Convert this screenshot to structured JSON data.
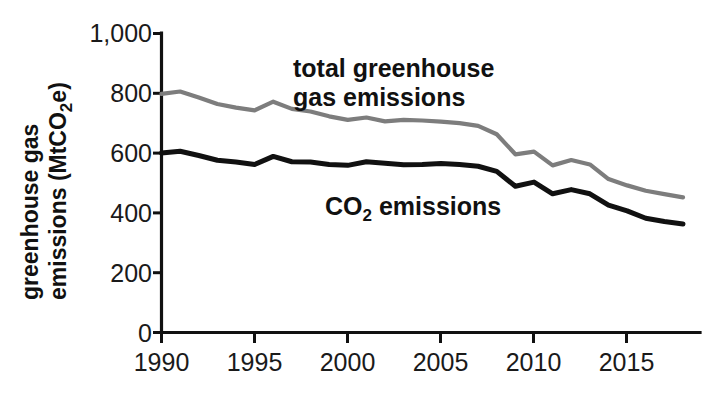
{
  "chart_data": {
    "type": "line",
    "title": "",
    "xlabel": "",
    "ylabel": "greenhouse gas emissions (MtCO2e)",
    "ylabel_parts": {
      "pre": "greenhouse gas emissions (MtCO",
      "sub": "2",
      "post": "e)"
    },
    "xlim": [
      1990,
      2018
    ],
    "ylim": [
      0,
      1000
    ],
    "grid": false,
    "legend_position": "inline-annotation",
    "y_ticks": [
      0,
      200,
      400,
      600,
      800,
      1000
    ],
    "y_tick_labels": [
      "0",
      "200",
      "400",
      "600",
      "800",
      "1,000"
    ],
    "x_ticks": [
      1990,
      1995,
      2000,
      2005,
      2010,
      2015
    ],
    "x_tick_labels": [
      "1990",
      "1995",
      "2000",
      "2005",
      "2010",
      "2015"
    ],
    "x": [
      1990,
      1991,
      1992,
      1993,
      1994,
      1995,
      1996,
      1997,
      1998,
      1999,
      2000,
      2001,
      2002,
      2003,
      2004,
      2005,
      2006,
      2007,
      2008,
      2009,
      2010,
      2011,
      2012,
      2013,
      2014,
      2015,
      2016,
      2017,
      2018
    ],
    "series": [
      {
        "name": "total greenhouse gas emissions",
        "color": "#7d7d7d",
        "label_lines": [
          "total greenhouse",
          "gas emissions"
        ],
        "values": [
          798,
          806,
          786,
          764,
          752,
          743,
          772,
          748,
          739,
          723,
          711,
          719,
          706,
          711,
          709,
          705,
          700,
          691,
          663,
          596,
          605,
          559,
          577,
          562,
          513,
          492,
          474,
          463,
          452
        ]
      },
      {
        "name": "CO2 emissions",
        "color": "#111111",
        "label_parts": {
          "pre": "CO",
          "sub": "2",
          "post": " emissions"
        },
        "values": [
          600,
          606,
          592,
          576,
          570,
          562,
          589,
          571,
          570,
          562,
          559,
          571,
          566,
          561,
          562,
          565,
          562,
          556,
          539,
          489,
          503,
          464,
          478,
          464,
          426,
          407,
          382,
          371,
          363
        ]
      }
    ],
    "annotations": [
      {
        "id": "total-ghg-label",
        "text": "total greenhouse gas emissions",
        "at_x": 2001,
        "at_y": 880
      },
      {
        "id": "co2-label",
        "text": "CO2 emissions",
        "at_x": 2002,
        "at_y": 430
      }
    ]
  },
  "colors": {
    "total_series": "#7d7d7d",
    "co2_series": "#111111",
    "axis": "#111111",
    "background": "#ffffff"
  }
}
